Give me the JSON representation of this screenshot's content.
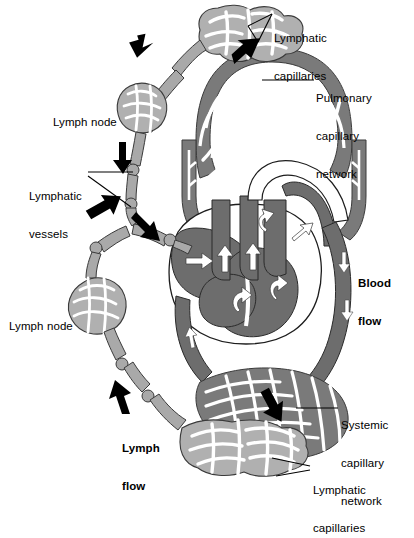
{
  "figure": {
    "background": "#ffffff",
    "colors": {
      "blood_vessel": "#6f6f6f",
      "blood_vessel_dark": "#616161",
      "lymph_vessel": "#a9a9a9",
      "lymph_fill": "#b4b4b4",
      "outline": "#1a1a1a",
      "arrow_white": "#ffffff",
      "arrow_black": "#000000",
      "leader_line": "#000000",
      "text": "#000000"
    }
  },
  "labels": {
    "lymphatic_capillaries_top": {
      "line1": "Lymphatic",
      "line2": "capillaries",
      "x": 274,
      "y": 8,
      "bold": false
    },
    "pulmonary_capillary_network": {
      "line1": "Pulmonary",
      "line2": "capillary",
      "line3": "network",
      "x": 316,
      "y": 68,
      "bold": false
    },
    "lymph_node_upper": {
      "line1": "Lymph node",
      "x": 53,
      "y": 92,
      "bold": false
    },
    "lymphatic_vessels": {
      "line1": "Lymphatic",
      "line2": "vessels",
      "x": 29,
      "y": 166,
      "bold": false
    },
    "blood_flow": {
      "line1": "Blood",
      "line2": "flow",
      "x": 358,
      "y": 253,
      "bold": true
    },
    "lymph_node_lower": {
      "line1": "Lymph node",
      "x": 9,
      "y": 296,
      "bold": false
    },
    "systemic_capillary_network": {
      "line1": "Systemic",
      "line2": "capillary",
      "line3": "network",
      "x": 341,
      "y": 395,
      "bold": false
    },
    "lymph_flow": {
      "line1": "Lymph",
      "line2": "flow",
      "x": 122,
      "y": 418,
      "bold": true
    },
    "lymphatic_capillaries_bottom": {
      "line1": "Lymphatic",
      "line2": "capillaries",
      "x": 313,
      "y": 460,
      "bold": false
    }
  },
  "structures": [
    {
      "name": "heart",
      "description": "Central four-chambered heart shown in cross-section with gray myocardium and white directional flow arrows"
    },
    {
      "name": "pulmonary-capillary-network",
      "description": "Arched mesh of elongated capillary cells above the heart"
    },
    {
      "name": "systemic-capillary-network",
      "description": "Crescent mesh of elongated capillary cells below and right of the heart"
    },
    {
      "name": "lymphatic-capillary-network-top",
      "description": "Irregular blind-ended lymphatic mesh at upper center"
    },
    {
      "name": "lymphatic-capillary-network-bottom",
      "description": "Irregular blind-ended lymphatic mesh at lower center"
    },
    {
      "name": "lymph-node-upper",
      "description": "Rounded nodular mesh on the upper lymphatic vessel"
    },
    {
      "name": "lymph-node-lower",
      "description": "Rounded nodular mesh on the lower lymphatic vessel"
    },
    {
      "name": "lymphatic-vessel-chain",
      "description": "Beaded valved lymphatic vessels running down the left side into the venous circulation"
    },
    {
      "name": "aorta-arch",
      "description": "Large vessel arching right from the heart toward the systemic network"
    }
  ],
  "flow_markers": {
    "black_arrows": 7,
    "white_arrows": 10,
    "black_arrow_meaning": "lymph flow direction",
    "white_arrow_meaning": "blood flow direction"
  }
}
